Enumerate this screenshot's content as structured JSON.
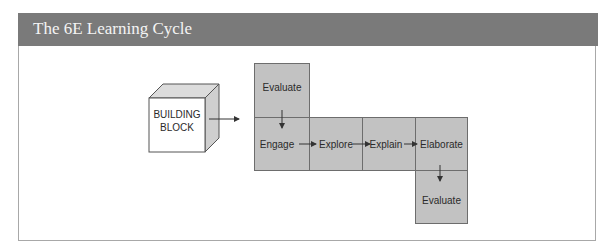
{
  "header": {
    "title": "The 6E Learning Cycle"
  },
  "diagram": {
    "building_block": {
      "line1": "BUILDING",
      "line2": "BLOCK"
    },
    "stages": {
      "evaluate_top": "Evaluate",
      "engage": "Engage",
      "explore": "Explore",
      "explain": "Explain",
      "elaborate": "Elaborate",
      "evaluate_bottom": "Evaluate"
    },
    "colors": {
      "box_fill": "#c2c2c2",
      "header_bg": "#7a7a7a"
    }
  }
}
